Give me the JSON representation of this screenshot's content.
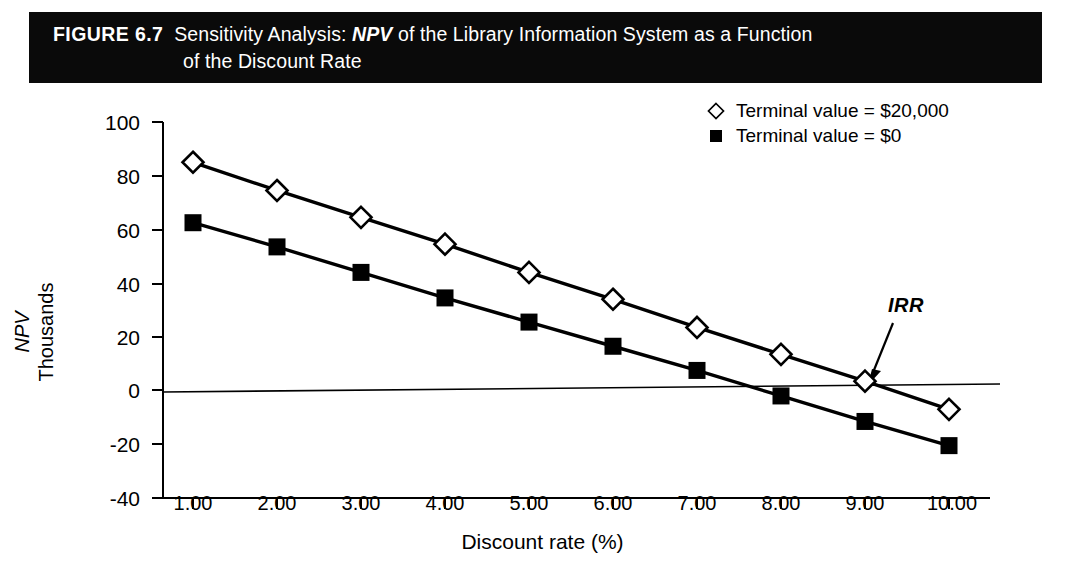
{
  "figure": {
    "label": "FIGURE 6.7",
    "title_line1_pre": "Sensitivity Analysis: ",
    "title_line1_italic": "NPV",
    "title_line1_post": " of the Library Information System as a Function",
    "title_line2": "of the Discount Rate"
  },
  "legend": {
    "position": "top-right",
    "items": [
      {
        "marker": "open-diamond-icon",
        "label": "Terminal value = $20,000"
      },
      {
        "marker": "filled-square-icon",
        "label": "Terminal value = $0"
      }
    ]
  },
  "annotations": [
    {
      "name": "irr-annotation",
      "text": "IRR",
      "points_to_x": 9.0,
      "points_to_y": 3.5
    }
  ],
  "axes": {
    "y_title_line1": "NPV",
    "y_title_line2": "Thousands",
    "x_title": "Discount rate (%)",
    "y_ticks": [
      "100",
      "80",
      "60",
      "40",
      "20",
      "0",
      "-20",
      "-40"
    ],
    "x_ticks": [
      "1.00",
      "2.00",
      "3.00",
      "4.00",
      "5.00",
      "6.00",
      "7.00",
      "8.00",
      "9.00",
      "10.00"
    ]
  },
  "chart_data": {
    "type": "line",
    "title": "Sensitivity Analysis: NPV of the Library Information System as a Function of the Discount Rate",
    "xlabel": "Discount rate (%)",
    "ylabel": "NPV Thousands",
    "x": [
      1,
      2,
      3,
      4,
      5,
      6,
      7,
      8,
      9,
      10
    ],
    "xtick_labels": [
      "1.00",
      "2.00",
      "3.00",
      "4.00",
      "5.00",
      "6.00",
      "7.00",
      "8.00",
      "9.00",
      "10.00"
    ],
    "ytick_labels": [
      "-40",
      "-20",
      "0",
      "20",
      "40",
      "60",
      "80",
      "100"
    ],
    "xlim": [
      0.5,
      10.5
    ],
    "ylim": [
      -40,
      100
    ],
    "grid": false,
    "legend_position": "top-right",
    "zero_line": true,
    "series": [
      {
        "name": "Terminal value = $20,000",
        "marker": "open-diamond",
        "color": "#000000",
        "values": [
          85,
          74.5,
          64.5,
          54.5,
          44,
          34,
          23.5,
          13.5,
          3.5,
          -7
        ]
      },
      {
        "name": "Terminal value = $0",
        "marker": "filled-square",
        "color": "#000000",
        "values": [
          62.5,
          53.5,
          44,
          34.5,
          25.5,
          16.5,
          7.5,
          -2,
          -11.5,
          -20.5
        ]
      }
    ],
    "annotations": [
      {
        "text": "IRR",
        "x": 9.0,
        "y": 3.5
      }
    ]
  },
  "colors": {
    "title_bar_background": "#0a0a0a",
    "title_bar_text": "#ffffff",
    "plot_ink": "#000000",
    "page_background": "#ffffff"
  }
}
